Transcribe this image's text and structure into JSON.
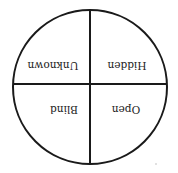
{
  "diagram": {
    "type": "johari-window",
    "orientation": "rotated-180",
    "quadrants": {
      "top_left": "Unknown",
      "top_right": "Hidden",
      "bottom_left": "Blind",
      "bottom_right": "Open"
    },
    "colors": {
      "stroke": "#1a1a1a",
      "text": "#222222",
      "background": "#ffffff"
    }
  }
}
